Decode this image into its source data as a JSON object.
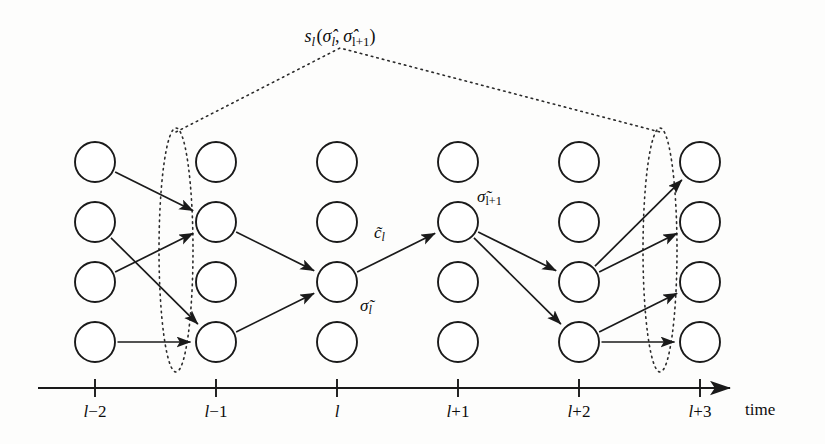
{
  "figure": {
    "type": "trellis-diagram",
    "top_label": {
      "text": "s_l(σ̂_l, σ̂_l+1)",
      "base": "s",
      "base_sub": "l",
      "arg1": "σ̂",
      "arg1_sub": "l",
      "arg2": "σ̂",
      "arg2_sub": "l+1",
      "x": 340,
      "y": 26
    },
    "node_labels": [
      {
        "name": "c-tilde-l",
        "base": "c̃",
        "sub": "l",
        "x": 374,
        "y": 224
      },
      {
        "name": "sigma-tilde-l",
        "base": "σ̃",
        "sub": "l",
        "x": 360,
        "y": 297
      },
      {
        "name": "sigma-tilde-l-plus-1",
        "base": "σ̃",
        "sub": "l+1",
        "x": 477,
        "y": 188
      }
    ],
    "axis": {
      "name": "time",
      "label_x": 745,
      "label_y": 400,
      "y": 388,
      "x_start": 38,
      "x_end": 730,
      "ticks": [
        {
          "label": "l−2",
          "x": 95
        },
        {
          "label": "l−1",
          "x": 216
        },
        {
          "label": "l",
          "x": 337
        },
        {
          "label": "l+1",
          "x": 458
        },
        {
          "label": "l+2",
          "x": 579
        },
        {
          "label": "l+3",
          "x": 700
        }
      ]
    },
    "grid": {
      "columns_x": [
        95,
        216,
        337,
        458,
        579,
        700
      ],
      "rows_y": [
        162,
        222,
        282,
        342
      ],
      "node_radius": 20,
      "stroke": "#1a1a1a"
    },
    "nodes": [
      {
        "col": 0,
        "row": 0
      },
      {
        "col": 0,
        "row": 1
      },
      {
        "col": 0,
        "row": 2
      },
      {
        "col": 0,
        "row": 3
      },
      {
        "col": 1,
        "row": 0
      },
      {
        "col": 1,
        "row": 1
      },
      {
        "col": 1,
        "row": 2
      },
      {
        "col": 1,
        "row": 3
      },
      {
        "col": 2,
        "row": 0
      },
      {
        "col": 2,
        "row": 1
      },
      {
        "col": 2,
        "row": 2
      },
      {
        "col": 2,
        "row": 3
      },
      {
        "col": 3,
        "row": 0
      },
      {
        "col": 3,
        "row": 1
      },
      {
        "col": 3,
        "row": 2
      },
      {
        "col": 3,
        "row": 3
      },
      {
        "col": 4,
        "row": 0
      },
      {
        "col": 4,
        "row": 1
      },
      {
        "col": 4,
        "row": 2
      },
      {
        "col": 4,
        "row": 3
      },
      {
        "col": 5,
        "row": 0
      },
      {
        "col": 5,
        "row": 1
      },
      {
        "col": 5,
        "row": 2
      },
      {
        "col": 5,
        "row": 3
      }
    ],
    "edges": [
      {
        "from": {
          "col": 0,
          "row": 0
        },
        "to": {
          "col": 1,
          "row": 1
        }
      },
      {
        "from": {
          "col": 0,
          "row": 1
        },
        "to": {
          "col": 1,
          "row": 3
        }
      },
      {
        "from": {
          "col": 0,
          "row": 2
        },
        "to": {
          "col": 1,
          "row": 1
        }
      },
      {
        "from": {
          "col": 0,
          "row": 3
        },
        "to": {
          "col": 1,
          "row": 3
        }
      },
      {
        "from": {
          "col": 1,
          "row": 1
        },
        "to": {
          "col": 2,
          "row": 2
        }
      },
      {
        "from": {
          "col": 1,
          "row": 3
        },
        "to": {
          "col": 2,
          "row": 2
        }
      },
      {
        "from": {
          "col": 2,
          "row": 2
        },
        "to": {
          "col": 3,
          "row": 1
        }
      },
      {
        "from": {
          "col": 3,
          "row": 1
        },
        "to": {
          "col": 4,
          "row": 2
        }
      },
      {
        "from": {
          "col": 3,
          "row": 1
        },
        "to": {
          "col": 4,
          "row": 3
        }
      },
      {
        "from": {
          "col": 4,
          "row": 2
        },
        "to": {
          "col": 5,
          "row": 0
        }
      },
      {
        "from": {
          "col": 4,
          "row": 2
        },
        "to": {
          "col": 5,
          "row": 1
        }
      },
      {
        "from": {
          "col": 4,
          "row": 3
        },
        "to": {
          "col": 5,
          "row": 2
        }
      },
      {
        "from": {
          "col": 4,
          "row": 3
        },
        "to": {
          "col": 5,
          "row": 3
        }
      }
    ],
    "ellipses": [
      {
        "name": "state-group-l-minus-1",
        "cx": 176,
        "cy": 250,
        "rx": 17,
        "ry": 122
      },
      {
        "name": "state-group-l-plus-2",
        "cx": 660,
        "cy": 250,
        "rx": 17,
        "ry": 122
      }
    ],
    "bracket": {
      "apex_x": 340,
      "apex_y": 48,
      "left_x": 176,
      "left_y": 132,
      "right_x": 660,
      "right_y": 132
    },
    "colors": {
      "ink": "#1a1a1a",
      "paper": "#fdfdfc",
      "dotted": "#2b2b2b"
    }
  }
}
